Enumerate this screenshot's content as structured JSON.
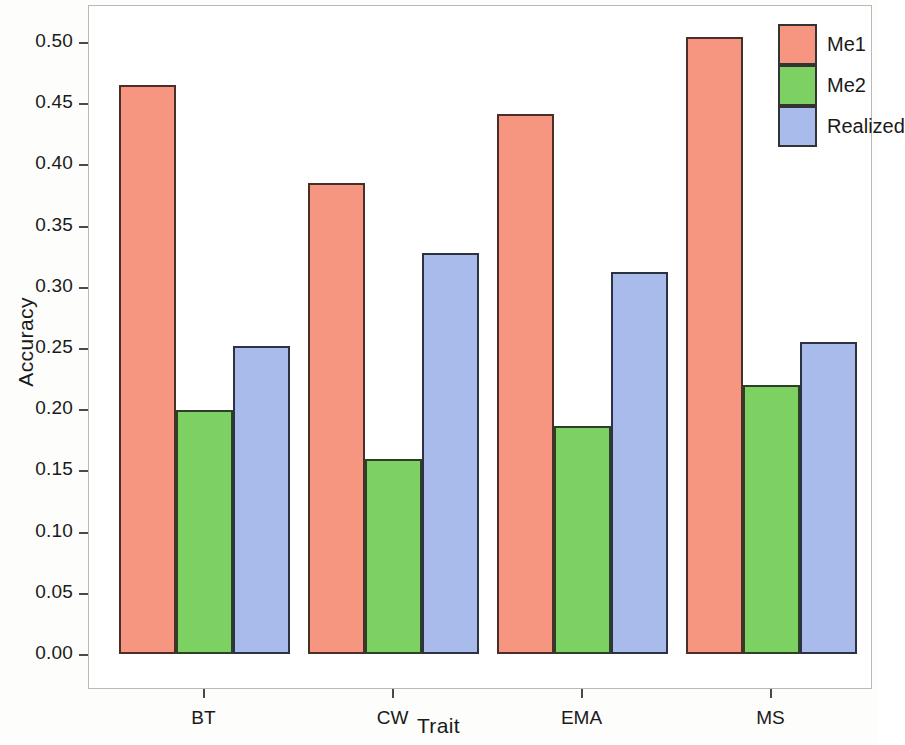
{
  "chart_data": {
    "type": "bar",
    "title": "",
    "xlabel": "Trait",
    "ylabel": "Accuracy",
    "categories": [
      "BT",
      "CW",
      "EMA",
      "MS"
    ],
    "series": [
      {
        "name": "Me1",
        "color": "#f79680",
        "values": [
          0.465,
          0.385,
          0.441,
          0.504
        ]
      },
      {
        "name": "Me2",
        "color": "#7dd163",
        "values": [
          0.199,
          0.159,
          0.186,
          0.22
        ]
      },
      {
        "name": "Realized",
        "color": "#a8bbea",
        "values": [
          0.252,
          0.328,
          0.312,
          0.255
        ]
      }
    ],
    "ylim": [
      0.0,
      0.555
    ],
    "yticks": [
      0.0,
      0.05,
      0.1,
      0.15,
      0.2,
      0.25,
      0.3,
      0.35,
      0.4,
      0.45,
      0.5
    ],
    "ytick_labels": [
      "0.00",
      "0.05",
      "0.10",
      "0.15",
      "0.20",
      "0.25",
      "0.30",
      "0.35",
      "0.40",
      "0.45",
      "0.50"
    ],
    "grid": false,
    "legend_position": "top-right",
    "legend_entries": [
      "Me1",
      "Me2",
      "Realized"
    ]
  },
  "legend": {
    "items": [
      {
        "label": "Me1",
        "swatch": "me1"
      },
      {
        "label": "Me2",
        "swatch": "me2"
      },
      {
        "label": "Realized",
        "swatch": "realized"
      }
    ]
  },
  "axes": {
    "y_title": "Accuracy",
    "x_title": "Trait"
  }
}
